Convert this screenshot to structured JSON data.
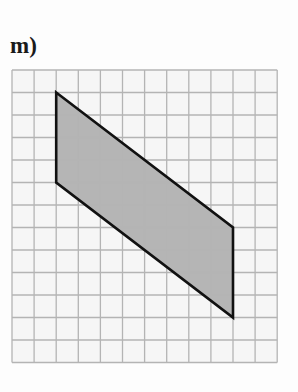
{
  "label": "m)",
  "grid": {
    "cols": 12,
    "rows": 13,
    "origin_x": 12,
    "origin_y": 70,
    "cell_w": 22.1,
    "cell_h": 22.5,
    "line_color": "#b4b4b4",
    "background": "#f6f6f6"
  },
  "shape": {
    "type": "parallelogram",
    "vertices": [
      [
        2,
        1
      ],
      [
        10,
        7
      ],
      [
        10,
        11
      ],
      [
        2,
        5
      ]
    ],
    "fill": "#b5b5b5",
    "stroke": "#111111",
    "stroke_width": 2.6
  }
}
